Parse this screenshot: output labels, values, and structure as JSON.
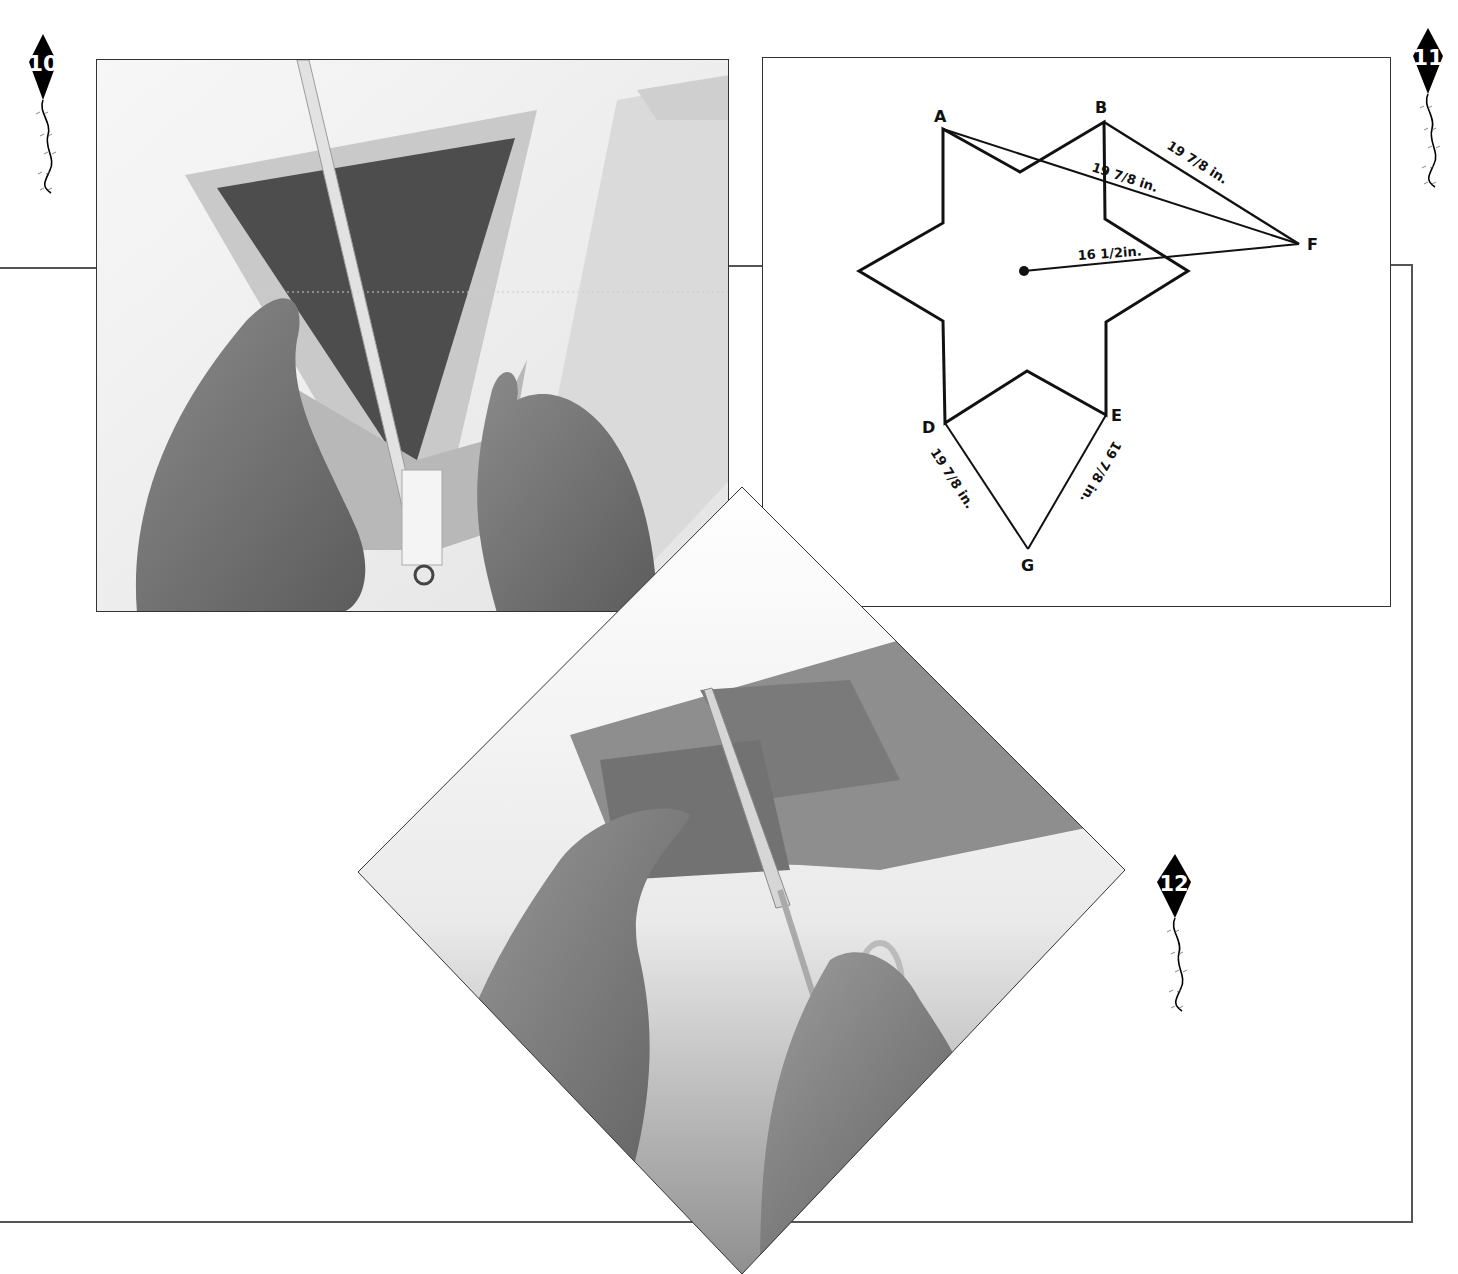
{
  "page": {
    "background": "#ffffff",
    "frame_color": "#555555"
  },
  "steps": [
    {
      "number": "10",
      "icon": "kite-icon",
      "image_description": "Hands folding tape edging over a triangular sail panel with a wooden dowel and a D-ring at the bottom"
    },
    {
      "number": "11",
      "icon": "kite-icon",
      "image_description": "Six-pointed star template diagram with measurement lines"
    },
    {
      "number": "12",
      "icon": "kite-icon",
      "image_description": "Hands cutting folded ripstop fabric with scissors (diamond-cropped photo)"
    }
  ],
  "diagram": {
    "points": {
      "A": "A",
      "B": "B",
      "D": "D",
      "E": "E",
      "F": "F",
      "G": "G"
    },
    "measurements": {
      "b_to_f": "19 7/8 in.",
      "a_to_f": "19 7/8 in.",
      "center_to_f": "16 1/2in.",
      "d_to_g": "19 7/8 in.",
      "e_to_g": "19 7/8 in."
    },
    "measurement_parts": {
      "whole_19": "19",
      "frac_7_8": "7/8",
      "unit_in": "in.",
      "whole_16": "16",
      "frac_1_2": "1/2",
      "unit_in2": "in."
    }
  }
}
